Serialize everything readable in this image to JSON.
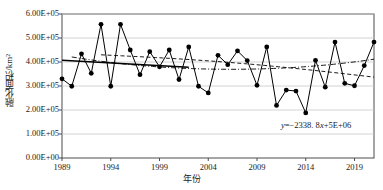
{
  "chart_data": {
    "type": "line",
    "title": "",
    "xlabel": "年份",
    "ylabel": "融化面积/km²",
    "xlim": [
      1989,
      2021
    ],
    "ylim": [
      0,
      600000
    ],
    "grid": true,
    "legend_position": "none",
    "x_ticks": [
      "1989",
      "1994",
      "1999",
      "2004",
      "2009",
      "2014",
      "2019"
    ],
    "x_tick_values": [
      1989,
      1994,
      1999,
      2004,
      2009,
      2014,
      2019
    ],
    "y_ticks": [
      "0.00E+00",
      "1.00E+05",
      "2.00E+05",
      "3.00E+05",
      "4.00E+05",
      "5.00E+05",
      "6.00E+05"
    ],
    "y_tick_values": [
      0,
      100000,
      200000,
      300000,
      400000,
      500000,
      600000
    ],
    "x": [
      1989,
      1990,
      1991,
      1992,
      1993,
      1994,
      1995,
      1996,
      1997,
      1998,
      1999,
      2000,
      2001,
      2002,
      2003,
      2004,
      2005,
      2006,
      2007,
      2008,
      2009,
      2010,
      2011,
      2012,
      2013,
      2014,
      2015,
      2016,
      2017,
      2018,
      2019,
      2020,
      2021
    ],
    "series": [
      {
        "name": "融化面积",
        "style": "solid-marker",
        "values": [
          330000,
          299000,
          434000,
          353000,
          557000,
          299000,
          557000,
          450000,
          347000,
          443000,
          380000,
          450000,
          327000,
          463000,
          299000,
          271000,
          428000,
          389000,
          446000,
          406000,
          303000,
          463000,
          219000,
          283000,
          279000,
          188000,
          407000,
          295000,
          483000,
          311000,
          301000,
          385000,
          483000
        ]
      }
    ],
    "trendlines": [
      {
        "name": "linear-trend",
        "style": "solid",
        "equation": "y=−2338. 8x+5E+06",
        "slope": -2338.8,
        "intercept": 5000000,
        "endpoints": [
          [
            1989,
            407000
          ],
          [
            2002,
            378000
          ]
        ]
      },
      {
        "name": "moving-average-dashdot",
        "style": "dash-dot",
        "endpoints": [
          [
            1990,
            421000
          ],
          [
            2021,
            415000
          ]
        ]
      },
      {
        "name": "moving-average-dashed",
        "style": "dashed",
        "endpoints": [
          [
            1993,
            430000
          ],
          [
            2021,
            337000
          ]
        ]
      }
    ],
    "annotations": [
      {
        "name": "trend-equation",
        "text_prefix": "y",
        "text_rest": "=−2338. 8",
        "text_var": "x",
        "text_tail": "+5E+06",
        "full_text": "y=−2338. 8x+5E+06",
        "x_px": 281,
        "y_px": 120
      }
    ]
  },
  "axis": {
    "y_label": "融化面积/km²",
    "x_label": "年份"
  }
}
